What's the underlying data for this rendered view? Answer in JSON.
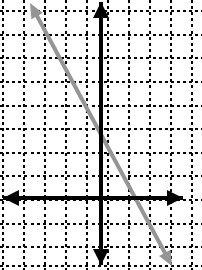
{
  "figure": {
    "title": "",
    "width": 202,
    "height": 270,
    "background_color": "#ffffff"
  },
  "chart_data": {
    "type": "line",
    "title": "",
    "xlabel": "",
    "ylabel": "",
    "grid": true,
    "legend": "none",
    "axes": {
      "x_axis": {
        "color": "#000000",
        "pixel_y": 198,
        "pixel_x_start": 3,
        "pixel_x_end": 183,
        "arrow_left": true,
        "arrow_right": true,
        "tick_labels": []
      },
      "y_axis": {
        "color": "#000000",
        "pixel_x": 101,
        "pixel_y_start": 2,
        "pixel_y_end": 265,
        "arrow_up": true,
        "arrow_down": true,
        "tick_labels": []
      }
    },
    "grid_lines": {
      "color": "#000000",
      "style": "dashed",
      "vertical_x": [
        3,
        24,
        45,
        66,
        87,
        108,
        129,
        150,
        171,
        192
      ],
      "horizontal_y": [
        11,
        35,
        58,
        82,
        106,
        129,
        153,
        176,
        200,
        224,
        247,
        266
      ],
      "cell_width": 21,
      "cell_height": 23.5
    },
    "series": [
      {
        "name": "line",
        "color": "#959595",
        "style": "solid",
        "arrow_start": true,
        "arrow_end": true,
        "points": [
          {
            "px": 30,
            "py": 3
          },
          {
            "px": 172,
            "py": 266
          }
        ],
        "x_intercept_px": 137,
        "y_intercept_px": 133,
        "slope_px": -1.852
      }
    ],
    "xlim": [
      3,
      192
    ],
    "ylim": [
      11,
      266
    ]
  },
  "colors": {
    "axis": "#000000",
    "grid": "#000000",
    "line": "#959595",
    "background": "#ffffff"
  }
}
